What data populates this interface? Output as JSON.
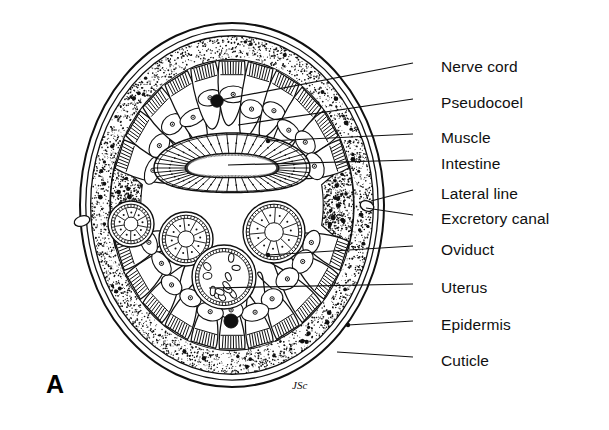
{
  "figure": {
    "panel_letter": "A",
    "artist_signature": "JSc",
    "background_color": "#ffffff",
    "ink_color": "#101010"
  },
  "labels": [
    {
      "id": "nerve-cord",
      "text": "Nerve cord",
      "text_x": 441,
      "text_y": 67,
      "leader_x1": 413,
      "leader_y1": 63,
      "leader_x2": 215,
      "leader_y2": 101,
      "dot": true
    },
    {
      "id": "pseudocoel",
      "text": "Pseudocoel",
      "text_x": 441,
      "text_y": 103,
      "leader_x1": 413,
      "leader_y1": 99,
      "leader_x2": 238,
      "leader_y2": 125,
      "dot": false
    },
    {
      "id": "muscle",
      "text": "Muscle",
      "text_x": 441,
      "text_y": 138,
      "leader_x1": 413,
      "leader_y1": 134,
      "leader_x2": 268,
      "leader_y2": 141,
      "dot": true
    },
    {
      "id": "intestine",
      "text": "Intestine",
      "text_x": 441,
      "text_y": 164,
      "leader_x1": 413,
      "leader_y1": 160,
      "leader_x2": 228,
      "leader_y2": 165,
      "dot": false
    },
    {
      "id": "lateral-line",
      "text": "Lateral line",
      "text_x": 441,
      "text_y": 194,
      "leader_x1": 413,
      "leader_y1": 190,
      "leader_x2": 371,
      "leader_y2": 201,
      "dot": false
    },
    {
      "id": "excretory-canal",
      "text": "Excretory canal",
      "text_x": 441,
      "text_y": 219,
      "leader_x1": 413,
      "leader_y1": 215,
      "leader_x2": 366,
      "leader_y2": 208,
      "dot": false
    },
    {
      "id": "oviduct",
      "text": "Oviduct",
      "text_x": 441,
      "text_y": 250,
      "leader_x1": 413,
      "leader_y1": 246,
      "leader_x2": 268,
      "leader_y2": 255,
      "dot": true
    },
    {
      "id": "uterus",
      "text": "Uterus",
      "text_x": 441,
      "text_y": 288,
      "leader_x1": 413,
      "leader_y1": 284,
      "leader_x2": 209,
      "leader_y2": 288,
      "dot": false
    },
    {
      "id": "epidermis",
      "text": "Epidermis",
      "text_x": 441,
      "text_y": 325,
      "leader_x1": 413,
      "leader_y1": 321,
      "leader_x2": 348,
      "leader_y2": 325,
      "dot": true
    },
    {
      "id": "cuticle",
      "text": "Cuticle",
      "text_x": 441,
      "text_y": 361,
      "leader_x1": 413,
      "leader_y1": 357,
      "leader_x2": 337,
      "leader_y2": 352,
      "dot": false
    }
  ],
  "anatomy": {
    "body_outline": {
      "cx": 232,
      "cy": 205,
      "rx": 152,
      "ry": 182
    },
    "cuticle_rings": [
      1.0,
      0.962,
      0.93
    ],
    "epidermis_band": {
      "outer": 0.93,
      "inner": 0.8
    },
    "nerve_cords": [
      {
        "name": "dorsal-nerve-cord",
        "x": 217,
        "y": 101,
        "r": 6.2
      },
      {
        "name": "ventral-nerve-cord",
        "x": 231,
        "y": 321,
        "r": 7.0
      }
    ],
    "intestine": {
      "cx": 232,
      "cy": 168,
      "rx": 78,
      "ry": 35,
      "cell_count": 46
    },
    "oviducts": [
      {
        "name": "oviduct-left",
        "cx": 131,
        "cy": 224,
        "r": 23,
        "spokes": 9
      },
      {
        "name": "oviduct-mid",
        "cx": 186,
        "cy": 239,
        "r": 27,
        "spokes": 10
      },
      {
        "name": "oviduct-right",
        "cx": 274,
        "cy": 232,
        "r": 31,
        "spokes": 11
      }
    ],
    "uterus": {
      "cx": 224,
      "cy": 277,
      "r": 32,
      "egg_count": 12
    },
    "lateral_lines": [
      {
        "name": "lateral-line-left",
        "cx": 82,
        "cy": 221,
        "canal_rx": 8,
        "canal_ry": 5
      },
      {
        "name": "lateral-line-right",
        "cx": 367,
        "cy": 206,
        "canal_rx": 7,
        "canal_ry": 5
      }
    ],
    "muscle_cell_count": 26
  }
}
